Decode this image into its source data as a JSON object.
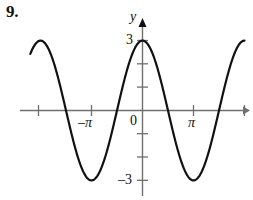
{
  "problem": {
    "number": "9."
  },
  "figure": {
    "axis_color": "#6f6f6f",
    "curve_color": "#111111",
    "labels": {
      "y_axis": "y",
      "y_max": "3",
      "y_min": "–3",
      "origin": "0",
      "x_neg_pi": "–π",
      "x_pi": "π"
    }
  },
  "chart_data": {
    "type": "line",
    "title": "",
    "xlabel": "",
    "ylabel": "y",
    "function": "y = 3 cos(x)",
    "amplitude": 3,
    "period": "2π",
    "xlim": [
      "-2.2π",
      "2π"
    ],
    "ylim": [
      -3.6,
      3.6
    ],
    "grid": false,
    "legend": null,
    "x_ticks": [
      {
        "value": "-2π",
        "label": ""
      },
      {
        "value": "-π",
        "label": "–π"
      },
      {
        "value": "0",
        "label": "0"
      },
      {
        "value": "π",
        "label": "π"
      },
      {
        "value": "2π",
        "label": ""
      }
    ],
    "y_ticks": [
      {
        "value": 3,
        "label": "3"
      },
      {
        "value": 2,
        "label": ""
      },
      {
        "value": 1,
        "label": ""
      },
      {
        "value": -1,
        "label": ""
      },
      {
        "value": -2,
        "label": ""
      },
      {
        "value": -3,
        "label": "–3"
      }
    ],
    "key_points": [
      {
        "x": "-2π",
        "y": 3,
        "kind": "maximum"
      },
      {
        "x": "-3π/2",
        "y": 0,
        "kind": "x-intercept"
      },
      {
        "x": "-π",
        "y": -3,
        "kind": "minimum"
      },
      {
        "x": "-π/2",
        "y": 0,
        "kind": "x-intercept"
      },
      {
        "x": "0",
        "y": 3,
        "kind": "maximum"
      },
      {
        "x": "π/2",
        "y": 0,
        "kind": "x-intercept"
      },
      {
        "x": "π",
        "y": -3,
        "kind": "minimum"
      },
      {
        "x": "3π/2",
        "y": 0,
        "kind": "x-intercept"
      },
      {
        "x": "2π",
        "y": 3,
        "kind": "maximum"
      }
    ]
  }
}
